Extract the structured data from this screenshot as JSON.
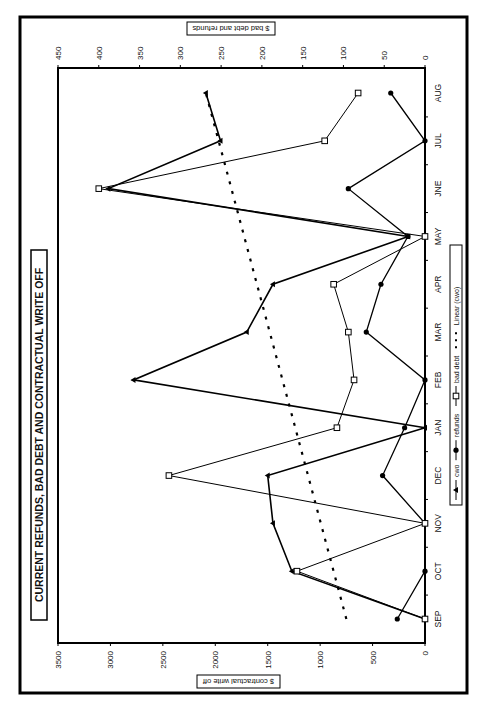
{
  "chart_data": {
    "type": "line",
    "title": "CURRENT REFUNDS, BAD DEBT AND CONTRACTUAL WRITE OFF",
    "orientation": "rotated 90deg counter-clockwise (page printed sideways)",
    "categories": [
      "SEP",
      "OCT",
      "NOV",
      "DEC",
      "JAN",
      "FEB",
      "MAR",
      "APR",
      "MAY",
      "JNE",
      "JUL",
      "AUG"
    ],
    "xlabel": "",
    "ylabel_left": "$ contractual write off",
    "ylabel_right": "$ bad debt and refunds",
    "ylim_left": [
      0,
      3500
    ],
    "yticks_left": [
      0,
      500,
      1000,
      1500,
      2000,
      2500,
      3000,
      3500
    ],
    "ylim_right": [
      0,
      450
    ],
    "yticks_right": [
      0,
      50,
      100,
      150,
      200,
      250,
      300,
      350,
      400,
      450
    ],
    "grid": false,
    "legend_position": "bottom",
    "series": [
      {
        "name": "cwo",
        "axis": "left",
        "marker": "triangle",
        "values": [
          0,
          1270,
          1450,
          1500,
          0,
          2780,
          1700,
          1450,
          160,
          3020,
          1950,
          2090
        ]
      },
      {
        "name": "refunds",
        "axis": "right",
        "marker": "filled-diamond",
        "values": [
          34,
          0,
          0,
          52,
          25,
          0,
          72,
          54,
          21,
          94,
          0,
          42
        ]
      },
      {
        "name": "bad debt",
        "axis": "right",
        "marker": "open-square",
        "values": [
          0,
          157,
          0,
          314,
          108,
          87,
          94,
          112,
          0,
          400,
          123,
          82
        ]
      },
      {
        "name": "Linear (cwo)",
        "axis": "left",
        "style": "dashed-trendline",
        "values": [
          750,
          870,
          990,
          1110,
          1230,
          1360,
          1480,
          1600,
          1720,
          1840,
          1970,
          2090
        ]
      }
    ]
  },
  "labels": {
    "title": "CURRENT REFUNDS, BAD DEBT AND CONTRACTUAL WRITE OFF",
    "left_axis_title": "$ contractual write off",
    "right_axis_title": "$ bad debt and refunds"
  },
  "legend": {
    "items": [
      {
        "label": "cwo"
      },
      {
        "label": "refunds"
      },
      {
        "label": "bad debt"
      },
      {
        "label": "Linear (cwo)"
      }
    ]
  }
}
